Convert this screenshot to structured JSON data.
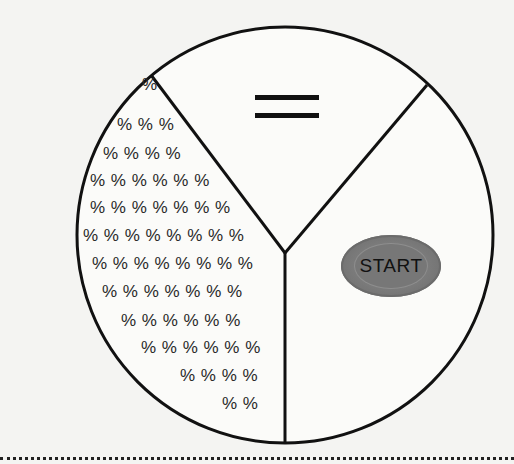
{
  "diagram": {
    "type": "circle divided into three sectors",
    "sectors": [
      {
        "position": "top",
        "symbol": "equals-sign"
      },
      {
        "position": "right",
        "content": "start-button"
      },
      {
        "position": "left",
        "fill_symbol": "%"
      }
    ]
  },
  "equals_symbol": "=",
  "start_button": {
    "label": "START"
  },
  "percent_rows": [
    {
      "text": "%",
      "x": 142,
      "y": 89
    },
    {
      "text": "% % %",
      "x": 117,
      "y": 129
    },
    {
      "text": "% % % %",
      "x": 103,
      "y": 158
    },
    {
      "text": "% % % % % %",
      "x": 90,
      "y": 185
    },
    {
      "text": "% % % % % % %",
      "x": 90,
      "y": 212
    },
    {
      "text": "% % % % % % % %",
      "x": 83,
      "y": 240
    },
    {
      "text": "% % % % % % % %",
      "x": 92,
      "y": 268
    },
    {
      "text": "% % % % % % %",
      "x": 102,
      "y": 296
    },
    {
      "text": "% % % % % %",
      "x": 121,
      "y": 325
    },
    {
      "text": "% % % % % %",
      "x": 141,
      "y": 352
    },
    {
      "text": "% % % %",
      "x": 180,
      "y": 380
    },
    {
      "text": "% %",
      "x": 222,
      "y": 408
    }
  ],
  "colors": {
    "background": "#f4f4f2",
    "stroke": "#111111",
    "button_fill": "#7a7a7a"
  }
}
